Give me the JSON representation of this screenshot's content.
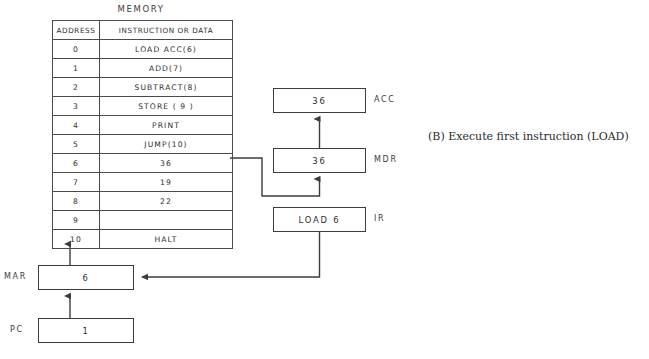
{
  "figure": {
    "caption": "(B)  Execute first instruction (LOAD)"
  },
  "memory": {
    "title": "MEMORY",
    "columns": [
      "ADDRESS",
      "INSTRUCTION OR DATA"
    ],
    "rows": [
      {
        "address": "0",
        "content": "LOAD ACC(6)"
      },
      {
        "address": "1",
        "content": "ADD(7)"
      },
      {
        "address": "2",
        "content": "SUBTRACT(8)"
      },
      {
        "address": "3",
        "content": "STORE ( 9 )"
      },
      {
        "address": "4",
        "content": "PRINT"
      },
      {
        "address": "5",
        "content": "JUMP(10)"
      },
      {
        "address": "6",
        "content": "36"
      },
      {
        "address": "7",
        "content": "19"
      },
      {
        "address": "8",
        "content": "22"
      },
      {
        "address": "9",
        "content": ""
      },
      {
        "address": "10",
        "content": "HALT"
      }
    ]
  },
  "registers": {
    "acc": {
      "label": "ACC",
      "value": "36"
    },
    "mdr": {
      "label": "MDR",
      "value": "36"
    },
    "ir": {
      "label": "IR",
      "value": "LOAD 6"
    },
    "mar": {
      "label": "MAR",
      "value": "6"
    },
    "pc": {
      "label": "PC",
      "value": "1"
    }
  },
  "colors": {
    "line": "#3c3c3c",
    "text": "#2d2d2d",
    "background": "#ffffff"
  }
}
